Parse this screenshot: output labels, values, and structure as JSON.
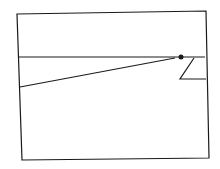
{
  "diagram": {
    "type": "line-drawing",
    "stroke_color": "#1a1a1a",
    "background": "#ffffff",
    "frame": {
      "points": "17,14 206,11 209,158 22,160"
    },
    "horizontal_line": {
      "x1": 19,
      "y1": 57,
      "x2": 205,
      "y2": 57
    },
    "slanted_line": {
      "x1": 20,
      "y1": 87,
      "x2": 175,
      "y2": 58
    },
    "marker": {
      "cx": 181,
      "cy": 57,
      "r": 2.5
    },
    "z_shape": {
      "points": "194,58 180,79 206,79"
    }
  }
}
